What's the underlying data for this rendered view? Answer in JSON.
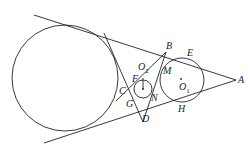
{
  "diagram": {
    "type": "geometry",
    "colors": {
      "stroke": "#222222",
      "background": "#ffffff"
    },
    "circles": [
      {
        "id": "big",
        "cx": 65,
        "cy": 78,
        "r": 53
      },
      {
        "id": "O1",
        "cx": 182,
        "cy": 80,
        "r": 22
      },
      {
        "id": "O2",
        "cx": 143,
        "cy": 89,
        "r": 9
      }
    ],
    "labels": {
      "A": "A",
      "B": "B",
      "C": "C",
      "D": "D",
      "E": "E",
      "F": "F",
      "G": "G",
      "H": "H",
      "M": "M",
      "N": "N",
      "O1": "O",
      "O1_sub": "1",
      "O2": "O",
      "O2_sub": "2"
    }
  }
}
